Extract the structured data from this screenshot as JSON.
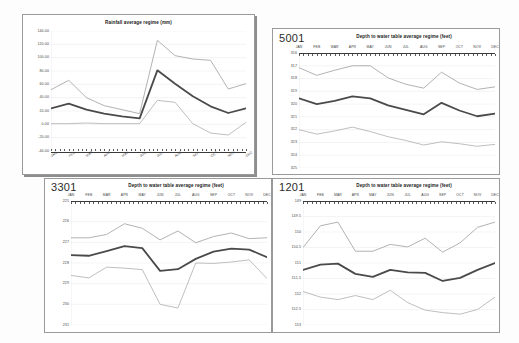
{
  "page": {
    "background": "#fdfdfd",
    "panel_count": 4
  },
  "colors": {
    "mean_line": "#4a4a4a",
    "upper_line": "#a9a9a9",
    "lower_line": "#b7b7b7",
    "axis": "#3a3a3a",
    "grid": "#e3e3e3",
    "border": "#9a9a9a"
  },
  "months": [
    "JAN",
    "FEB",
    "MAR",
    "APR",
    "MAY",
    "JUN",
    "JUL",
    "AUG",
    "SEP",
    "OCT",
    "NOV",
    "DEC"
  ],
  "panels": [
    {
      "key": "rainfall",
      "id_label": "",
      "title": "Rainfall average regime (mm)"
    },
    {
      "key": "w5001",
      "id_label": "5001",
      "title": "Depth to water table average regime (feet)"
    },
    {
      "key": "w3301",
      "id_label": "3301",
      "title": "Depth to water table average regime (feet)"
    },
    {
      "key": "w1201",
      "id_label": "1201",
      "title": "Depth to water table average regime (feet)"
    }
  ],
  "chart_data": [
    {
      "key": "rainfall",
      "type": "line",
      "title": "Rainfall average regime (mm)",
      "xlabel": "",
      "ylabel": "",
      "x": [
        "JAN",
        "FEB",
        "MAR",
        "APR",
        "MAY",
        "JUN",
        "JUL",
        "AUG",
        "SEP",
        "OCT",
        "NOV",
        "DEC"
      ],
      "ytick_labels": [
        "140.00",
        "120.00",
        "100.00",
        "80.00",
        "60.00",
        "40.00",
        "20.00",
        "0.00",
        "-20.00",
        "-40.00"
      ],
      "ylim": [
        -40,
        140
      ],
      "yinvert": false,
      "grid": true,
      "legend": "none",
      "series": [
        {
          "name": "upper",
          "values": [
            52,
            66,
            40,
            28,
            22,
            16,
            126,
            103,
            98,
            96,
            53,
            61
          ]
        },
        {
          "name": "mean",
          "values": [
            24,
            31,
            22,
            16,
            12,
            9,
            81,
            61,
            42,
            27,
            17,
            24
          ]
        },
        {
          "name": "lower",
          "values": [
            1,
            1,
            2,
            1,
            1,
            1,
            36,
            33,
            1,
            -13,
            -16,
            3
          ]
        }
      ]
    },
    {
      "key": "w5001",
      "type": "line",
      "title": "Depth to water table average regime (feet)",
      "id_label": "5001",
      "xlabel": "",
      "ylabel": "",
      "x": [
        "JAN",
        "FEB",
        "MAR",
        "APR",
        "MAY",
        "JUN",
        "JUL",
        "AUG",
        "SEP",
        "OCT",
        "NOV",
        "DEC"
      ],
      "ytick_labels": [
        "316",
        "317",
        "318",
        "319",
        "320",
        "321",
        "322",
        "323",
        "324",
        "325"
      ],
      "ylim": [
        316,
        325
      ],
      "yinvert": true,
      "grid": true,
      "legend": "none",
      "series": [
        {
          "name": "shallow",
          "values": [
            317.15,
            317.75,
            317.35,
            317.0,
            317.0,
            317.95,
            318.45,
            318.75,
            317.5,
            318.35,
            318.85,
            318.65
          ]
        },
        {
          "name": "mean",
          "values": [
            319.55,
            320.0,
            319.75,
            319.4,
            319.55,
            320.1,
            320.45,
            320.8,
            319.9,
            320.5,
            320.95,
            320.75
          ]
        },
        {
          "name": "deep",
          "values": [
            322.0,
            322.35,
            322.1,
            321.8,
            322.15,
            322.55,
            322.85,
            323.2,
            322.95,
            323.1,
            323.3,
            323.15
          ]
        }
      ]
    },
    {
      "key": "w3301",
      "type": "line",
      "title": "Depth to water table average regime (feet)",
      "id_label": "3301",
      "xlabel": "",
      "ylabel": "",
      "x": [
        "JAN",
        "FEB",
        "MAR",
        "APR",
        "MAY",
        "JUN",
        "JUL",
        "AUG",
        "SEP",
        "OCT",
        "NOV",
        "DEC"
      ],
      "ytick_labels": [
        "225",
        "226",
        "227",
        "228",
        "229",
        "230",
        "231"
      ],
      "ylim": [
        225,
        231
      ],
      "yinvert": true,
      "grid": true,
      "legend": "none",
      "series": [
        {
          "name": "shallow",
          "values": [
            226.78,
            226.78,
            226.62,
            226.1,
            226.32,
            226.88,
            226.45,
            227.02,
            226.72,
            226.55,
            226.82,
            226.78
          ]
        },
        {
          "name": "mean",
          "values": [
            227.62,
            227.65,
            227.42,
            227.18,
            227.28,
            228.38,
            228.3,
            227.8,
            227.45,
            227.3,
            227.35,
            227.72
          ]
        },
        {
          "name": "deep",
          "values": [
            228.6,
            228.72,
            228.2,
            228.25,
            228.32,
            230.0,
            230.18,
            228.0,
            228.02,
            227.95,
            227.85,
            228.75
          ]
        }
      ]
    },
    {
      "key": "w1201",
      "type": "line",
      "title": "Depth to water table average regime (feet)",
      "id_label": "1201",
      "xlabel": "",
      "ylabel": "",
      "x": [
        "JAN",
        "FEB",
        "MAR",
        "APR",
        "MAY",
        "JUN",
        "JUL",
        "AUG",
        "SEP",
        "OCT",
        "NOV",
        "DEC"
      ],
      "ytick_labels": [
        "149",
        "149.5",
        "150",
        "150.5",
        "151",
        "151.5",
        "152",
        "152.5",
        "153"
      ],
      "ylim": [
        149,
        153
      ],
      "yinvert": true,
      "grid": true,
      "legend": "none",
      "series": [
        {
          "name": "shallow",
          "values": [
            150.5,
            149.8,
            149.68,
            150.62,
            150.62,
            150.4,
            150.48,
            150.2,
            150.65,
            150.35,
            149.85,
            149.68
          ]
        },
        {
          "name": "mean",
          "values": [
            151.22,
            151.05,
            151.02,
            151.35,
            151.45,
            151.22,
            151.3,
            151.32,
            151.58,
            151.48,
            151.22,
            151.0
          ]
        },
        {
          "name": "deep",
          "values": [
            151.92,
            152.1,
            152.18,
            152.05,
            152.18,
            151.88,
            152.28,
            152.52,
            152.6,
            152.65,
            152.5,
            152.1
          ]
        }
      ]
    }
  ]
}
